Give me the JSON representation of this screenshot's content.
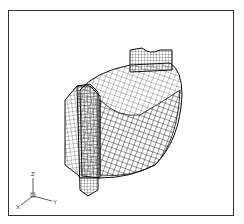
{
  "figure": {
    "axis_triad": {
      "labels": {
        "x": "X",
        "y": "Y",
        "z": "Z"
      }
    },
    "colors": {
      "mesh": "#111111",
      "frame": "#333333",
      "background": "#ffffff"
    }
  }
}
